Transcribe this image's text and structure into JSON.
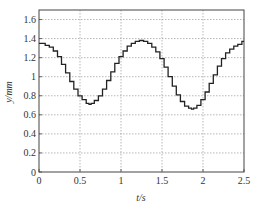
{
  "chart_data": {
    "type": "line",
    "title": "",
    "xlabel": "t/s",
    "ylabel": "y/mm",
    "xlim": [
      0,
      2.5
    ],
    "ylim": [
      0,
      1.7
    ],
    "xticks": [
      0,
      0.5,
      1,
      1.5,
      2,
      2.5
    ],
    "xtick_labels": [
      "0",
      "0.5",
      "1",
      "1.5",
      "2",
      "2.5"
    ],
    "yticks": [
      0,
      0.2,
      0.4,
      0.6,
      0.8,
      1.0,
      1.2,
      1.4,
      1.6
    ],
    "ytick_labels": [
      "0",
      "0.2",
      "0.4",
      "0.6",
      "0.8",
      "1",
      "1.2",
      "1.4",
      "1.6"
    ],
    "grid": true,
    "legend": null,
    "series": [
      {
        "name": "y",
        "color": "#222222",
        "style": "stepped",
        "x": [
          0,
          0.05,
          0.1,
          0.15,
          0.2,
          0.25,
          0.3,
          0.35,
          0.4,
          0.45,
          0.5,
          0.55,
          0.6,
          0.62,
          0.65,
          0.7,
          0.75,
          0.8,
          0.85,
          0.9,
          0.95,
          1.0,
          1.05,
          1.1,
          1.15,
          1.2,
          1.25,
          1.3,
          1.35,
          1.4,
          1.45,
          1.5,
          1.55,
          1.6,
          1.65,
          1.7,
          1.75,
          1.8,
          1.85,
          1.87,
          1.9,
          1.95,
          2.0,
          2.05,
          2.1,
          2.15,
          2.2,
          2.25,
          2.3,
          2.35,
          2.4,
          2.45,
          2.5
        ],
        "y": [
          1.35,
          1.35,
          1.33,
          1.31,
          1.27,
          1.21,
          1.13,
          1.04,
          0.95,
          0.87,
          0.8,
          0.76,
          0.72,
          0.71,
          0.72,
          0.75,
          0.8,
          0.87,
          0.96,
          1.05,
          1.14,
          1.21,
          1.27,
          1.32,
          1.35,
          1.37,
          1.38,
          1.37,
          1.35,
          1.31,
          1.26,
          1.19,
          1.1,
          1.0,
          0.9,
          0.81,
          0.74,
          0.69,
          0.67,
          0.66,
          0.67,
          0.7,
          0.76,
          0.84,
          0.93,
          1.02,
          1.11,
          1.19,
          1.25,
          1.29,
          1.32,
          1.34,
          1.37
        ]
      }
    ]
  }
}
